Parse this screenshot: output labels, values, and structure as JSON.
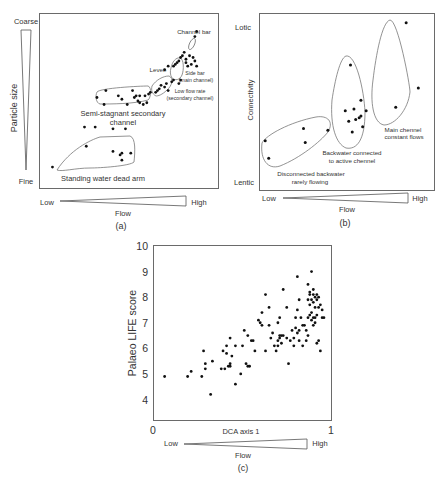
{
  "figure": {
    "panel_a": {
      "label": "(a)",
      "y_axis": {
        "title": "Particle size",
        "top": "Coarse",
        "bottom": "Fine"
      },
      "x_axis": {
        "title": "Flow",
        "left": "Low",
        "right": "High"
      },
      "groups": [
        {
          "name": "Channel bar",
          "label_line1": "Channel bar"
        },
        {
          "name": "Levee",
          "label_line1": "Levee"
        },
        {
          "name": "Side bar (main channel)",
          "label_line1": "Side bar",
          "label_line2": "(main channel)"
        },
        {
          "name": "Low flow rate (secondary channel)",
          "label_line1": "Low flow rate",
          "label_line2": "(secondary channel)"
        },
        {
          "name": "Semi-stagnant secondary channel",
          "label_line1": "Semi-stagnant secondary",
          "label_line2": "channel"
        },
        {
          "name": "Standing water dead arm",
          "label_line1": "Standing water dead arm"
        }
      ]
    },
    "panel_b": {
      "label": "(b)",
      "y_axis": {
        "title": "Connectivity",
        "top": "Lotic",
        "bottom": "Lentic"
      },
      "x_axis": {
        "title": "Flow",
        "left": "Low",
        "right": "High"
      },
      "groups": [
        {
          "name": "Main chennel constant flows",
          "label_line1": "Main chennel",
          "label_line2": "constant flows"
        },
        {
          "name": "Backwater connected to active chennel",
          "label_line1": "Backwater connected",
          "label_line2": "to active chennel"
        },
        {
          "name": "Disconnected backwater rarely flowing",
          "label_line1": "Disconnected backwater",
          "label_line2": "rarely flowing"
        }
      ]
    },
    "panel_c": {
      "label": "(c)",
      "x_axis": {
        "title": "DCA axis 1",
        "min_label": "0",
        "max_label": "1"
      },
      "y_axis": {
        "title": "Palaeo LIFE score",
        "ticks": [
          "10",
          "9",
          "8",
          "7",
          "6",
          "5",
          "4"
        ]
      },
      "flow": {
        "title": "Flow",
        "left": "Low",
        "right": "High"
      }
    }
  },
  "chart_data": [
    {
      "type": "scatter",
      "title": "(a)",
      "xlabel": "Flow (Low → High)",
      "ylabel": "Particle size (Fine → Coarse)",
      "grid": false,
      "note": "Conceptual diagram; axes unscaled. Points given in relative 0–1 units.",
      "series": [
        {
          "name": "Standing water dead arm",
          "points": [
            [
              0.07,
              0.12
            ],
            [
              0.25,
              0.35
            ],
            [
              0.26,
              0.24
            ],
            [
              0.31,
              0.35
            ],
            [
              0.41,
              0.21
            ],
            [
              0.41,
              0.34
            ],
            [
              0.45,
              0.19
            ],
            [
              0.46,
              0.2
            ],
            [
              0.46,
              0.16
            ],
            [
              0.48,
              0.34
            ],
            [
              0.51,
              0.2
            ]
          ]
        },
        {
          "name": "Semi-stagnant secondary channel",
          "points": [
            [
              0.32,
              0.52
            ],
            [
              0.36,
              0.48
            ],
            [
              0.37,
              0.56
            ],
            [
              0.44,
              0.53
            ],
            [
              0.46,
              0.51
            ],
            [
              0.49,
              0.48
            ],
            [
              0.52,
              0.56
            ],
            [
              0.53,
              0.52
            ],
            [
              0.54,
              0.53
            ],
            [
              0.55,
              0.5
            ],
            [
              0.56,
              0.49
            ],
            [
              0.56,
              0.53
            ],
            [
              0.58,
              0.48
            ],
            [
              0.59,
              0.53
            ],
            [
              0.6,
              0.49
            ],
            [
              0.61,
              0.54
            ],
            [
              0.62,
              0.55
            ]
          ]
        },
        {
          "name": "Low flow rate (secondary channel)",
          "points": [
            [
              0.65,
              0.55
            ],
            [
              0.66,
              0.56
            ],
            [
              0.67,
              0.57
            ],
            [
              0.68,
              0.59
            ],
            [
              0.7,
              0.58
            ],
            [
              0.71,
              0.6
            ],
            [
              0.72,
              0.56
            ],
            [
              0.74,
              0.61
            ],
            [
              0.75,
              0.62
            ],
            [
              0.78,
              0.6
            ],
            [
              0.79,
              0.62
            ]
          ]
        },
        {
          "name": "Levee",
          "points": [
            [
              0.7,
              0.68
            ],
            [
              0.72,
              0.7
            ]
          ]
        },
        {
          "name": "Side bar (main channel)",
          "points": [
            [
              0.75,
              0.7
            ],
            [
              0.76,
              0.71
            ],
            [
              0.77,
              0.72
            ],
            [
              0.78,
              0.73
            ],
            [
              0.79,
              0.75
            ],
            [
              0.8,
              0.76
            ],
            [
              0.81,
              0.78
            ],
            [
              0.82,
              0.74
            ],
            [
              0.82,
              0.72
            ],
            [
              0.83,
              0.7
            ],
            [
              0.84,
              0.76
            ],
            [
              0.85,
              0.71
            ],
            [
              0.86,
              0.75
            ],
            [
              0.87,
              0.73
            ],
            [
              0.88,
              0.7
            ]
          ]
        },
        {
          "name": "Channel bar",
          "points": [
            [
              0.87,
              0.87
            ],
            [
              0.88,
              0.9
            ]
          ]
        }
      ]
    },
    {
      "type": "scatter",
      "title": "(b)",
      "xlabel": "Flow (Low → High)",
      "ylabel": "Connectivity (Lentic → Lotic)",
      "grid": false,
      "note": "Conceptual diagram; axes unscaled. Points given in relative 0–1 units.",
      "series": [
        {
          "name": "Disconnected backwater rarely flowing",
          "points": [
            [
              0.03,
              0.28
            ],
            [
              0.05,
              0.18
            ],
            [
              0.25,
              0.35
            ],
            [
              0.26,
              0.27
            ],
            [
              0.39,
              0.34
            ]
          ]
        },
        {
          "name": "Backwater connected to active chennel",
          "points": [
            [
              0.49,
              0.45
            ],
            [
              0.51,
              0.39
            ],
            [
              0.52,
              0.71
            ],
            [
              0.53,
              0.33
            ],
            [
              0.54,
              0.46
            ],
            [
              0.55,
              0.4
            ],
            [
              0.57,
              0.41
            ],
            [
              0.58,
              0.51
            ],
            [
              0.58,
              0.42
            ],
            [
              0.59,
              0.36
            ],
            [
              0.61,
              0.45
            ]
          ]
        },
        {
          "name": "Main chennel constant flows",
          "points": [
            [
              0.78,
              0.47
            ],
            [
              0.84,
              0.95
            ],
            [
              0.91,
              0.58
            ]
          ]
        }
      ]
    },
    {
      "type": "scatter",
      "title": "(c)",
      "xlabel": "DCA axis 1",
      "ylabel": "Palaeo LIFE score",
      "xlim": [
        0,
        1
      ],
      "ylim": [
        3.2,
        10
      ],
      "xticks": [
        0,
        1
      ],
      "yticks": [
        4,
        5,
        6,
        7,
        8,
        9,
        10
      ],
      "grid": false,
      "legend": null,
      "series": [
        {
          "name": "samples",
          "points": [
            [
              0.06,
              4.9
            ],
            [
              0.19,
              4.9
            ],
            [
              0.21,
              5.1
            ],
            [
              0.27,
              4.9
            ],
            [
              0.28,
              5.9
            ],
            [
              0.29,
              5.2
            ],
            [
              0.29,
              5.4
            ],
            [
              0.32,
              4.2
            ],
            [
              0.33,
              5.5
            ],
            [
              0.38,
              5.2
            ],
            [
              0.39,
              5.9
            ],
            [
              0.4,
              5.2
            ],
            [
              0.41,
              6.1
            ],
            [
              0.41,
              5.8
            ],
            [
              0.42,
              5.3
            ],
            [
              0.43,
              6.4
            ],
            [
              0.43,
              5.4
            ],
            [
              0.43,
              5.3
            ],
            [
              0.44,
              5.7
            ],
            [
              0.46,
              6.1
            ],
            [
              0.46,
              4.6
            ],
            [
              0.49,
              5.0
            ],
            [
              0.5,
              6.1
            ],
            [
              0.51,
              6.7
            ],
            [
              0.52,
              5.4
            ],
            [
              0.53,
              5.3
            ],
            [
              0.53,
              6.5
            ],
            [
              0.54,
              5.3
            ],
            [
              0.55,
              6.3
            ],
            [
              0.56,
              6.3
            ],
            [
              0.57,
              5.9
            ],
            [
              0.59,
              7.1
            ],
            [
              0.6,
              7.0
            ],
            [
              0.61,
              6.9
            ],
            [
              0.61,
              7.4
            ],
            [
              0.63,
              8.1
            ],
            [
              0.63,
              5.9
            ],
            [
              0.65,
              6.9
            ],
            [
              0.65,
              7.6
            ],
            [
              0.66,
              6.4
            ],
            [
              0.67,
              6.6
            ],
            [
              0.68,
              6.1
            ],
            [
              0.69,
              5.9
            ],
            [
              0.7,
              6.1
            ],
            [
              0.7,
              7.0
            ],
            [
              0.7,
              6.3
            ],
            [
              0.71,
              6.4
            ],
            [
              0.71,
              6.5
            ],
            [
              0.71,
              7.2
            ],
            [
              0.72,
              6.2
            ],
            [
              0.72,
              6.5
            ],
            [
              0.73,
              6.5
            ],
            [
              0.73,
              8.3
            ],
            [
              0.75,
              7.6
            ],
            [
              0.75,
              6.4
            ],
            [
              0.76,
              5.4
            ],
            [
              0.77,
              6.3
            ],
            [
              0.78,
              6.7
            ],
            [
              0.79,
              6.1
            ],
            [
              0.79,
              6.4
            ],
            [
              0.8,
              6.8
            ],
            [
              0.8,
              7.2
            ],
            [
              0.81,
              6.6
            ],
            [
              0.81,
              7.5
            ],
            [
              0.81,
              8.8
            ],
            [
              0.82,
              7.9
            ],
            [
              0.82,
              6.7
            ],
            [
              0.82,
              6.3
            ],
            [
              0.83,
              7.2
            ],
            [
              0.84,
              6.9
            ],
            [
              0.84,
              6.1
            ],
            [
              0.85,
              6.9
            ],
            [
              0.86,
              6.3
            ],
            [
              0.86,
              6.7
            ],
            [
              0.87,
              6.5
            ],
            [
              0.87,
              7.9
            ],
            [
              0.87,
              7.2
            ],
            [
              0.87,
              8.5
            ],
            [
              0.88,
              7.3
            ],
            [
              0.88,
              8.2
            ],
            [
              0.88,
              7.7
            ],
            [
              0.88,
              8.1
            ],
            [
              0.89,
              9.0
            ],
            [
              0.89,
              7.4
            ],
            [
              0.89,
              7.9
            ],
            [
              0.89,
              7.1
            ],
            [
              0.9,
              8.3
            ],
            [
              0.9,
              7.2
            ],
            [
              0.9,
              7.8
            ],
            [
              0.9,
              8.1
            ],
            [
              0.9,
              6.9
            ],
            [
              0.91,
              7.6
            ],
            [
              0.91,
              7.0
            ],
            [
              0.91,
              8.0
            ],
            [
              0.91,
              7.2
            ],
            [
              0.92,
              8.1
            ],
            [
              0.92,
              7.3
            ],
            [
              0.92,
              6.2
            ],
            [
              0.92,
              7.9
            ],
            [
              0.93,
              6.3
            ],
            [
              0.93,
              7.6
            ],
            [
              0.93,
              8.0
            ],
            [
              0.94,
              5.9
            ],
            [
              0.94,
              7.7
            ],
            [
              0.95,
              7.2
            ],
            [
              0.95,
              7.5
            ],
            [
              0.96,
              7.2
            ]
          ]
        }
      ]
    }
  ]
}
